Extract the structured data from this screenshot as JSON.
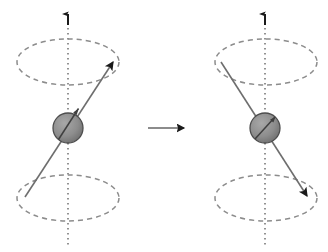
{
  "figure": {
    "width": 328,
    "height": 252,
    "background_color": "#ffffff"
  },
  "colors": {
    "axis_dotted": "#808080",
    "ellipse_dashed": "#8c8c8c",
    "spin_vector_line": "#6e6e6e",
    "arrowhead_fill": "#1a1a1a",
    "nucleus_fill": "#8a8a8a",
    "nucleus_stroke": "#4d4d4d",
    "transition_arrow_line": "#8c8c8c",
    "transition_arrow_head": "#1a1a1a"
  },
  "panels": [
    {
      "id": "left-panel",
      "name": "initial-spin-state",
      "state_label": "spin up (aligned with field)",
      "axis": {
        "name": "precession-axis",
        "style": "dotted",
        "x": 68,
        "y_top": 14,
        "y_bottom": 246,
        "arrow_direction": "up"
      },
      "upper_cone_ellipse": {
        "name": "upper-precession-circle",
        "cx": 68,
        "cy": 62,
        "rx": 51,
        "ry": 23,
        "style": "dashed"
      },
      "lower_cone_ellipse": {
        "name": "lower-precession-circle",
        "cx": 68,
        "cy": 198,
        "rx": 51,
        "ry": 23,
        "style": "dashed"
      },
      "nucleus": {
        "name": "nucleus-sphere",
        "cx": 68,
        "cy": 128,
        "r": 15
      },
      "spin_vector": {
        "name": "spin-vector-arrow",
        "tail_x": 25,
        "tail_y": 197,
        "tip_x": 115,
        "tip_y": 61,
        "direction": "up-right",
        "arrowhead_at": "tip"
      }
    },
    {
      "id": "right-panel",
      "name": "flipped-spin-state",
      "state_label": "spin down (opposed to field)",
      "axis": {
        "name": "precession-axis",
        "style": "dotted",
        "x": 265,
        "y_top": 14,
        "y_bottom": 246,
        "arrow_direction": "up"
      },
      "upper_cone_ellipse": {
        "name": "upper-precession-circle",
        "cx": 266,
        "cy": 62,
        "rx": 51,
        "ry": 23,
        "style": "dashed"
      },
      "lower_cone_ellipse": {
        "name": "lower-precession-circle",
        "cx": 266,
        "cy": 198,
        "rx": 51,
        "ry": 23,
        "style": "dashed"
      },
      "nucleus": {
        "name": "nucleus-sphere",
        "cx": 265,
        "cy": 128,
        "r": 15
      },
      "spin_vector": {
        "name": "spin-vector-arrow",
        "tail_x": 221,
        "tail_y": 62,
        "tip_x": 309,
        "tip_y": 198,
        "direction": "down-right",
        "arrowhead_at": "tip"
      }
    }
  ],
  "transition_arrow": {
    "name": "transition-arrow",
    "label": "",
    "x_start": 148,
    "x_end": 190,
    "y": 128,
    "direction": "right"
  }
}
